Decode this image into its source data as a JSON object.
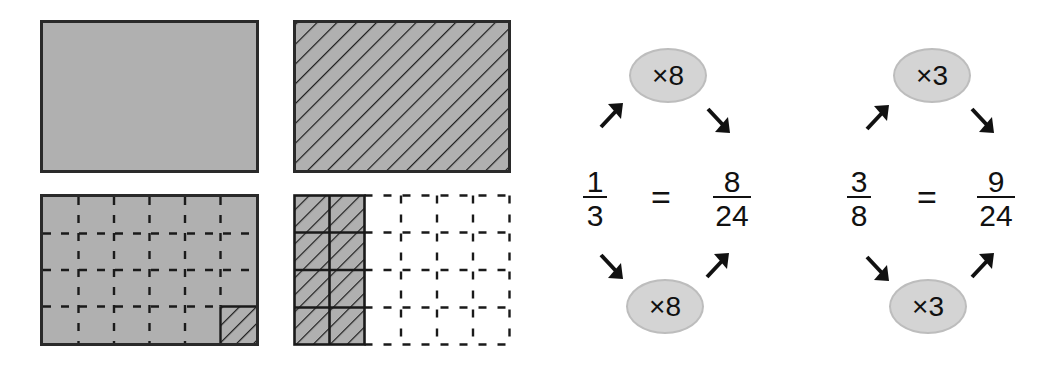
{
  "figure": {
    "rectangles": [
      {
        "id": "whole-shaded",
        "description": "Whole rectangle, fully gray shaded",
        "rows": 1,
        "cols": 1
      },
      {
        "id": "whole-hatched",
        "description": "Whole rectangle, diagonal hatching",
        "rows": 1,
        "cols": 1
      },
      {
        "id": "grid-shaded-1-of-24",
        "description": "Gray rectangle divided into 4x6 dashed grid, 1 cell hatched",
        "rows": 4,
        "cols": 6,
        "hatched_cells": 1
      },
      {
        "id": "grid-hatched-8-of-24",
        "description": "Rectangle divided into 4x6 grid, first 2 columns (8 cells) shaded and hatched",
        "rows": 4,
        "cols": 6,
        "hatched_cells": 8
      }
    ],
    "colors": {
      "shade": "#b0b0b0",
      "line": "#2a2a2a",
      "oval": "#d4d4d4"
    }
  },
  "equations": [
    {
      "left": {
        "numerator": "1",
        "denominator": "3"
      },
      "equals": "=",
      "right": {
        "numerator": "8",
        "denominator": "24"
      },
      "top_multiplier": "×8",
      "bottom_multiplier": "×8"
    },
    {
      "left": {
        "numerator": "3",
        "denominator": "8"
      },
      "equals": "=",
      "right": {
        "numerator": "9",
        "denominator": "24"
      },
      "top_multiplier": "×3",
      "bottom_multiplier": "×3"
    }
  ]
}
